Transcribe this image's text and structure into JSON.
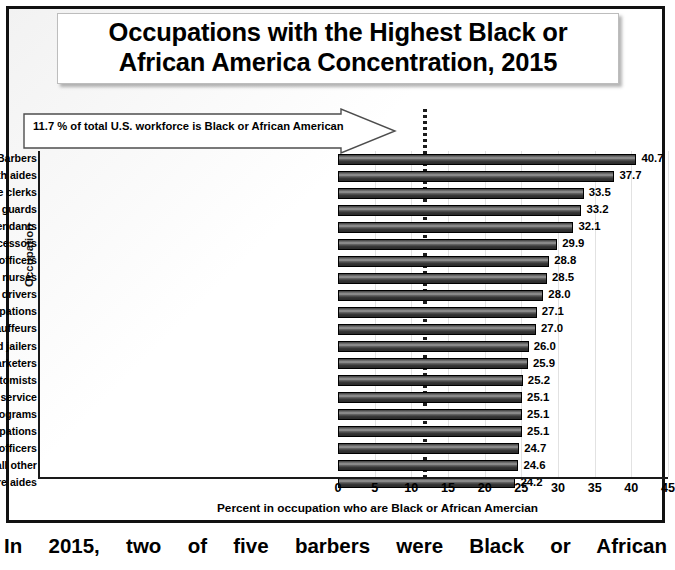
{
  "title": {
    "line1": "Occupations with the Highest Black or",
    "line2": "African America Concentration, 2015"
  },
  "callout": {
    "text": "11.7 % of total U.S. workforce is Black or African American",
    "value": 11.7
  },
  "caption": {
    "text": "In 2015, two of five barbers were Black or African"
  },
  "chart_data": {
    "type": "bar",
    "orientation": "horizontal",
    "title": "Occupations with the Highest Black or African America Concentration, 2015",
    "xlabel": "Percent in occupation who are Black or African Amercian",
    "ylabel": "Occupation",
    "xlim": [
      0,
      45
    ],
    "xticks": [
      0,
      5,
      10,
      15,
      20,
      25,
      30,
      35,
      40,
      45
    ],
    "grid": true,
    "legend": false,
    "reference_line": {
      "value": 11.7,
      "label": "11.7 % of total U.S. workforce is Black or African American",
      "style": "dotted"
    },
    "categories": [
      "Barbers",
      "Nursing, psychiatric, and home health aides",
      "Postal service clerks",
      "Crossing guards",
      "Parking lot attendants",
      "Postal service mail sorters, and processors",
      "Security guards and gaming surveillance officers",
      "Licensed practical and licensed vocational nurses",
      "Bus drivers",
      "Healthcare support occupations",
      "Taxi drivers and chauffeurs",
      "Bailiffs, correctional officers, and jailers",
      "Telemarketers",
      "Phlebotomists",
      "Mail clerks and mail machine operators, except postal service",
      "Eligibility interviewers, government programs",
      "Miscellaneous healthcare support occupations",
      "First-line supervisors of correctional officers",
      "Financial clerks, all other",
      "Personal care aides"
    ],
    "values": [
      40.7,
      37.7,
      33.5,
      33.2,
      32.1,
      29.9,
      28.8,
      28.5,
      28.0,
      27.1,
      27.0,
      26.0,
      25.9,
      25.2,
      25.1,
      25.1,
      25.1,
      24.7,
      24.6,
      24.2
    ],
    "value_labels": [
      "40.7",
      "37.7",
      "33.5",
      "33.2",
      "32.1",
      "29.9",
      "28.8",
      "28.5",
      "28.0",
      "27.1",
      "27.0",
      "26.0",
      "25.9",
      "25.2",
      "25.1",
      "25.1",
      "25.1",
      "24.7",
      "24.6",
      "24.2"
    ]
  }
}
